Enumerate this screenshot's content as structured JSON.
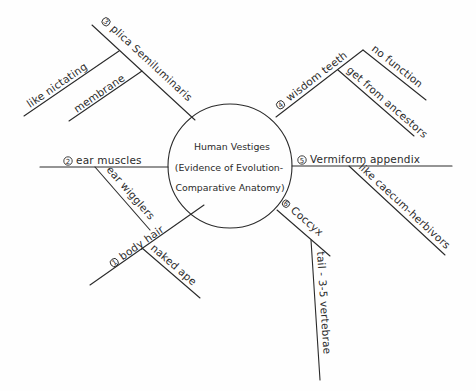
{
  "center": {
    "lines": [
      "Human Vestiges",
      "(Evidence of Evolution-",
      "Comparative Anatomy)"
    ]
  },
  "branches": [
    {
      "number": "1",
      "label": "body hair",
      "details": [
        "naked ape"
      ]
    },
    {
      "number": "2",
      "label": "ear muscles",
      "details": [
        "ear wigglers"
      ]
    },
    {
      "number": "3",
      "label": "plica Semiluminaris",
      "details": [
        "like nictating",
        "membrane"
      ]
    },
    {
      "number": "4",
      "label": "wisdom teeth",
      "details": [
        "no function",
        "get from ancestors"
      ]
    },
    {
      "number": "5",
      "label": "Vermiform appendix",
      "details": [
        "like caecum-herbivors"
      ]
    },
    {
      "number": "6",
      "label": "Coccyx",
      "details": [
        "tail - 3-5 vertebrae"
      ]
    }
  ],
  "colors": {
    "ink": "#2b2b2b",
    "paper": "#fefefe"
  }
}
